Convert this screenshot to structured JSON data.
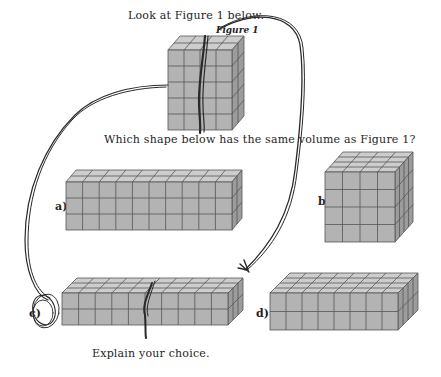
{
  "worksheet": {
    "instruction": "Look at Figure 1 below.",
    "figure_label": "Figure 1",
    "question": "Which shape below has the same volume as Figure 1?",
    "prompt": "Explain your choice."
  },
  "figure1": {
    "width_cubes": 4,
    "height_cubes": 5,
    "depth_cubes": 2
  },
  "options": [
    {
      "label": "a)",
      "width_cubes": 10,
      "height_cubes": 3,
      "depth_cubes": 2
    },
    {
      "label": "b)",
      "width_cubes": 4,
      "height_cubes": 4,
      "depth_cubes": 4
    },
    {
      "label": "c)",
      "width_cubes": 10,
      "height_cubes": 2,
      "depth_cubes": 3
    },
    {
      "label": "d)",
      "width_cubes": 8,
      "height_cubes": 2,
      "depth_cubes": 4
    }
  ],
  "annotations": {
    "circled_option": "c)",
    "ink_color": "#2a2a2a"
  },
  "colors": {
    "cube_front": "#b3b3b3",
    "cube_top": "#cdcdcd",
    "cube_side": "#9c9c9c",
    "cube_edge": "#555555"
  }
}
